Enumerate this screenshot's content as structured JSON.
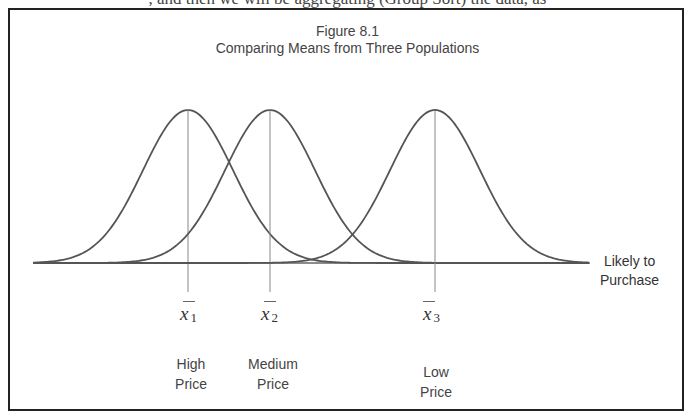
{
  "page": {
    "top_fragment": ", and then we will be aggregating (Group Sort) the data, as"
  },
  "figure": {
    "number": "Figure 8.1",
    "title": "Comparing Means from Three Populations",
    "axis_label_line1": "Likely to",
    "axis_label_line2": "Purchase",
    "means": [
      {
        "symbol": "x",
        "subscript": "1",
        "label_line1": "High",
        "label_line2": "Price"
      },
      {
        "symbol": "x",
        "subscript": "2",
        "label_line1": "Medium",
        "label_line2": "Price"
      },
      {
        "symbol": "x",
        "subscript": "3",
        "label_line1": "Low",
        "label_line2": "Price"
      }
    ]
  },
  "chart_data": {
    "type": "line",
    "title": "Figure 8.1 Comparing Means from Three Populations",
    "xlabel": "Likely to Purchase",
    "ylabel": "",
    "series": [
      {
        "name": "High Price",
        "distribution": "normal",
        "mean_label": "x̄1",
        "mean_position_px": 188,
        "sigma_px": 45
      },
      {
        "name": "Medium Price",
        "distribution": "normal",
        "mean_label": "x̄2",
        "mean_position_px": 270,
        "sigma_px": 45
      },
      {
        "name": "Low Price",
        "distribution": "normal",
        "mean_label": "x̄3",
        "mean_position_px": 435,
        "sigma_px": 45
      }
    ],
    "grid": false,
    "legend": "none; categories labeled below each mean"
  },
  "colors": {
    "curve": "#555555",
    "axis": "#666666",
    "border": "#222222",
    "text": "#444444"
  }
}
